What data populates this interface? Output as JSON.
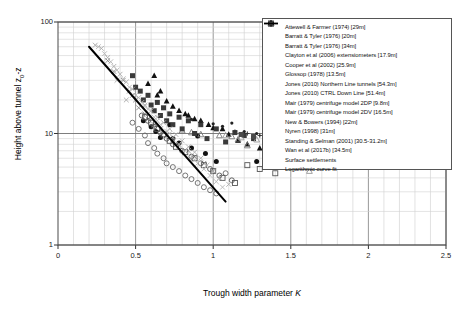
{
  "chart_data": {
    "type": "scatter",
    "title": "",
    "xlabel": "Trough width parameter K",
    "ylabel": "Height above tunnel z0-z",
    "xlim": [
      0,
      2.5
    ],
    "ylim": [
      1,
      100
    ],
    "yscale": "log",
    "xscale": "linear",
    "grid": true,
    "legend_position": "top-right",
    "xticks": [
      "0",
      "0.5",
      "1",
      "1.5",
      "2",
      "2.5"
    ],
    "xtick_values": [
      0,
      0.5,
      1,
      1.5,
      2,
      2.5
    ],
    "yticks": [
      "1",
      "10",
      "100"
    ],
    "ytick_values": [
      1,
      10,
      100
    ],
    "series": [
      {
        "name": "Attewell & Farmer (1974) [29m]",
        "marker": "filled-circle",
        "color": "#111111",
        "points": [
          [
            0.6,
            11.5
          ],
          [
            0.66,
            9.2
          ],
          [
            0.72,
            12.0
          ],
          [
            0.74,
            9.0
          ],
          [
            0.78,
            8.2
          ],
          [
            0.86,
            7.4
          ],
          [
            0.9,
            9.5
          ],
          [
            0.95,
            6.6
          ],
          [
            1.02,
            5.6
          ],
          [
            1.28,
            5.6
          ],
          [
            0.55,
            13.0
          ],
          [
            0.63,
            10.4
          ]
        ]
      },
      {
        "name": "Barratt & Tyler (1976) [20m]",
        "marker": "filled-triangle",
        "color": "#111111",
        "points": [
          [
            0.62,
            33.0
          ],
          [
            0.66,
            24.0
          ],
          [
            0.7,
            19.5
          ],
          [
            0.78,
            16.0
          ],
          [
            0.84,
            14.5
          ],
          [
            0.92,
            13.0
          ],
          [
            0.97,
            12.0
          ],
          [
            1.06,
            11.0
          ],
          [
            1.16,
            8.6
          ],
          [
            1.3,
            7.4
          ],
          [
            1.44,
            6.2
          ]
        ]
      },
      {
        "name": "Barratt & Tyler (1976) [34m]",
        "marker": "filled-triangle",
        "color": "#111111",
        "points": [
          [
            0.58,
            28.0
          ],
          [
            0.64,
            22.0
          ],
          [
            0.74,
            17.5
          ],
          [
            0.82,
            15.0
          ],
          [
            0.88,
            13.5
          ],
          [
            1.0,
            11.2
          ],
          [
            1.1,
            9.8
          ],
          [
            1.22,
            8.0
          ]
        ]
      },
      {
        "name": "Clayton et al (2006) extensometers [17.9m]",
        "marker": "open-triangle",
        "color": "#777777",
        "points": [
          [
            0.86,
            10.2
          ],
          [
            0.92,
            9.8
          ],
          [
            1.04,
            9.6
          ],
          [
            1.12,
            9.4
          ],
          [
            1.16,
            8.8
          ],
          [
            1.22,
            7.8
          ],
          [
            1.34,
            6.2
          ],
          [
            1.48,
            5.2
          ],
          [
            0.8,
            10.6
          ]
        ]
      },
      {
        "name": "Cooper et al (2002) [25.9m]",
        "marker": "x-cross",
        "color": "#888888",
        "points": [
          [
            0.42,
            30.0
          ],
          [
            0.46,
            24.0
          ],
          [
            0.5,
            20.0
          ],
          [
            0.52,
            17.0
          ],
          [
            0.56,
            15.0
          ],
          [
            0.58,
            13.5
          ],
          [
            0.62,
            12.0
          ],
          [
            0.66,
            11.0
          ],
          [
            0.7,
            9.8
          ],
          [
            0.74,
            8.8
          ],
          [
            0.78,
            7.8
          ],
          [
            0.84,
            7.0
          ],
          [
            0.88,
            6.2
          ],
          [
            0.94,
            5.4
          ],
          [
            1.0,
            4.6
          ],
          [
            0.36,
            36.0
          ],
          [
            0.32,
            45.0
          ],
          [
            0.48,
            22.0
          ]
        ]
      },
      {
        "name": "Glossop (1978) [13.5m]",
        "marker": "filled-square",
        "color": "#3a3a3a",
        "points": [
          [
            0.48,
            33.0
          ],
          [
            0.53,
            24.0
          ],
          [
            0.55,
            20.0
          ],
          [
            0.58,
            22.0
          ],
          [
            0.6,
            18.0
          ],
          [
            0.62,
            16.0
          ],
          [
            0.64,
            19.0
          ],
          [
            0.66,
            14.5
          ],
          [
            0.68,
            17.0
          ],
          [
            0.7,
            13.0
          ],
          [
            0.72,
            15.0
          ],
          [
            0.74,
            12.0
          ],
          [
            0.78,
            14.0
          ],
          [
            0.8,
            11.0
          ],
          [
            0.84,
            13.0
          ],
          [
            0.88,
            10.0
          ],
          [
            0.92,
            12.0
          ],
          [
            0.96,
            9.0
          ],
          [
            1.02,
            11.0
          ],
          [
            1.08,
            8.4
          ],
          [
            1.14,
            10.2
          ],
          [
            1.2,
            9.6
          ],
          [
            1.26,
            9.0
          ],
          [
            1.34,
            8.6
          ],
          [
            1.42,
            9.4
          ],
          [
            1.54,
            9.2
          ],
          [
            0.5,
            26.0
          ]
        ]
      },
      {
        "name": "Jones (2010) Northern Line tunnels [54.3m]",
        "marker": "open-triangle",
        "color": "#999999",
        "points": [
          [
            1.08,
            9.6
          ],
          [
            1.18,
            9.2
          ],
          [
            1.28,
            8.8
          ],
          [
            1.38,
            6.0
          ],
          [
            1.52,
            5.4
          ],
          [
            1.62,
            4.6
          ],
          [
            1.74,
            9.0
          ]
        ]
      },
      {
        "name": "Jones (2010) CTRL Down Line [51.4m]",
        "marker": "open-circle",
        "color": "#666666",
        "points": [
          [
            0.52,
            11.0
          ],
          [
            0.56,
            9.6
          ],
          [
            0.58,
            8.2
          ],
          [
            0.62,
            7.4
          ],
          [
            0.64,
            6.6
          ],
          [
            0.68,
            6.0
          ],
          [
            0.7,
            5.4
          ],
          [
            0.74,
            5.0
          ],
          [
            0.78,
            4.6
          ],
          [
            0.82,
            4.2
          ],
          [
            0.86,
            3.9
          ],
          [
            0.9,
            3.6
          ],
          [
            0.94,
            3.3
          ],
          [
            0.98,
            3.1
          ],
          [
            1.02,
            2.9
          ],
          [
            1.08,
            4.4
          ],
          [
            0.48,
            12.5
          ]
        ]
      },
      {
        "name": "Mair (1979) centrifuge model 2DP [9.8m]",
        "marker": "open-circle",
        "color": "#555555",
        "points": [
          [
            0.58,
            13.0
          ],
          [
            0.62,
            11.5
          ],
          [
            0.66,
            10.2
          ],
          [
            0.7,
            9.0
          ],
          [
            0.74,
            8.0
          ],
          [
            0.8,
            7.0
          ],
          [
            0.86,
            6.2
          ],
          [
            0.92,
            5.4
          ],
          [
            0.98,
            4.8
          ],
          [
            1.04,
            4.2
          ],
          [
            1.12,
            3.8
          ],
          [
            0.54,
            14.5
          ]
        ]
      },
      {
        "name": "Mair (1979) centrifuge model 2DV [16.5m]",
        "marker": "open-square",
        "color": "#555555",
        "points": [
          [
            0.6,
            12.5
          ],
          [
            0.64,
            11.0
          ],
          [
            0.68,
            9.8
          ],
          [
            0.72,
            8.6
          ],
          [
            0.76,
            7.6
          ],
          [
            0.82,
            6.8
          ],
          [
            0.88,
            6.0
          ],
          [
            0.94,
            5.2
          ],
          [
            1.0,
            4.6
          ],
          [
            1.06,
            4.0
          ],
          [
            1.14,
            3.6
          ],
          [
            1.22,
            5.2
          ],
          [
            1.3,
            4.8
          ],
          [
            1.4,
            4.4
          ],
          [
            0.56,
            14.0
          ]
        ]
      },
      {
        "name": "New & Bowers (1994) [22m]",
        "marker": "filled-circle-small",
        "color": "#222222",
        "points": [
          [
            0.92,
            12.8
          ],
          [
            1.0,
            12.2
          ],
          [
            1.06,
            11.6
          ],
          [
            1.12,
            12.4
          ],
          [
            1.2,
            10.4
          ],
          [
            1.28,
            10.0
          ],
          [
            1.36,
            9.4
          ],
          [
            1.46,
            9.8
          ],
          [
            0.86,
            13.4
          ]
        ]
      },
      {
        "name": "Nyren (1998) [31m]",
        "marker": "x-cross",
        "color": "#aaaaaa",
        "points": [
          [
            0.28,
            58.0
          ],
          [
            0.32,
            48.0
          ],
          [
            0.36,
            40.0
          ],
          [
            0.4,
            34.0
          ],
          [
            0.44,
            29.0
          ],
          [
            0.48,
            25.0
          ],
          [
            0.52,
            21.0
          ],
          [
            0.56,
            18.0
          ],
          [
            0.6,
            16.0
          ],
          [
            0.64,
            14.0
          ],
          [
            0.68,
            12.5
          ],
          [
            0.72,
            11.0
          ],
          [
            0.76,
            9.8
          ],
          [
            0.8,
            8.6
          ],
          [
            0.84,
            7.6
          ],
          [
            0.88,
            6.8
          ],
          [
            0.92,
            6.0
          ],
          [
            0.96,
            5.2
          ],
          [
            1.0,
            4.6
          ],
          [
            1.04,
            4.0
          ],
          [
            1.1,
            3.5
          ],
          [
            0.24,
            62.0
          ],
          [
            0.44,
            20.0
          ],
          [
            0.38,
            30.0
          ]
        ]
      },
      {
        "name": "Standing & Selman (2001) [30.5-31.2m]",
        "marker": "plus-dot",
        "color": "#333333",
        "points": [
          [
            1.14,
            10.4
          ],
          [
            1.22,
            10.0
          ],
          [
            1.3,
            9.6
          ],
          [
            1.44,
            9.2
          ],
          [
            1.6,
            9.0
          ],
          [
            1.76,
            8.6
          ],
          [
            1.88,
            5.6
          ]
        ]
      },
      {
        "name": "Wan et al (2017b) [34.5m]",
        "marker": "filled-square",
        "color": "#4a4a4a",
        "points": [
          [
            1.18,
            9.8
          ],
          [
            1.26,
            9.4
          ],
          [
            1.34,
            9.0
          ],
          [
            1.48,
            9.6
          ],
          [
            1.58,
            9.2
          ],
          [
            1.68,
            9.0
          ]
        ]
      },
      {
        "name": "Surface settlements",
        "marker": "x-cross",
        "color": "#b5b5b5",
        "points": [
          [
            0.3,
            52.0
          ],
          [
            0.34,
            44.0
          ],
          [
            0.38,
            37.0
          ],
          [
            0.42,
            31.0
          ],
          [
            0.46,
            26.0
          ],
          [
            0.5,
            22.0
          ],
          [
            0.54,
            19.0
          ],
          [
            0.58,
            16.5
          ],
          [
            0.62,
            14.0
          ],
          [
            0.66,
            12.0
          ],
          [
            0.7,
            10.5
          ],
          [
            0.74,
            9.2
          ],
          [
            0.78,
            8.0
          ],
          [
            0.82,
            7.0
          ],
          [
            0.86,
            6.2
          ],
          [
            0.9,
            5.4
          ],
          [
            0.94,
            4.8
          ],
          [
            0.98,
            4.2
          ],
          [
            1.02,
            3.7
          ],
          [
            1.06,
            3.3
          ],
          [
            0.26,
            60.0
          ],
          [
            0.64,
            13.0
          ],
          [
            0.56,
            17.5
          ],
          [
            0.72,
            10.0
          ],
          [
            0.88,
            5.8
          ]
        ]
      }
    ],
    "fit": {
      "name": "Logarithmic curve fit",
      "style": "solid-line",
      "color": "#000000",
      "endpoints": [
        [
          0.2,
          60.0
        ],
        [
          1.08,
          2.45
        ]
      ]
    }
  },
  "legend": {
    "items": [
      {
        "label": "Attewell & Farmer (1974) [29m]",
        "marker": "filled-circle"
      },
      {
        "label": "Barratt & Tyler (1976) [20m]",
        "marker": "filled-triangle"
      },
      {
        "label": "Barratt & Tyler (1976) [34m]",
        "marker": "filled-triangle"
      },
      {
        "label": "Clayton et al (2006) extensiometers [17.9m]",
        "marker": "open-triangle"
      },
      {
        "label": "Cooper et al (2002) [25.9m]",
        "marker": "x-cross"
      },
      {
        "label": "Glossop (1978) [13.5m]",
        "marker": "filled-square"
      },
      {
        "label": "Jones (2010) Northern Line tunnels [54.3m]",
        "marker": "open-triangle"
      },
      {
        "label": "Jones (2010) CTRL Down Line [51.4m]",
        "marker": "open-circle"
      },
      {
        "label": "Mair (1979) centrifuge model 2DP [9.8m]",
        "marker": "open-circle"
      },
      {
        "label": "Mair (1979) centrifuge model 2DV [16.5m]",
        "marker": "open-square"
      },
      {
        "label": "New & Bowers (1994) [22m]",
        "marker": "filled-circle-small"
      },
      {
        "label": "Nyren (1998) [31m]",
        "marker": "x-cross"
      },
      {
        "label": "Standing & Selman (2001) [30.5-31.2m]",
        "marker": "plus-dot"
      },
      {
        "label": "Wan et al (2017b) [34.5m]",
        "marker": "filled-square"
      },
      {
        "label": "Surface settlements",
        "marker": "x-cross"
      },
      {
        "label": "Logarithmic curve fit",
        "marker": "line"
      }
    ]
  },
  "axis_labels": {
    "y_prefix": "Height above tunnel z",
    "y_sub": "0",
    "y_suffix": "-z",
    "x_prefix": "Trough width parameter ",
    "x_italic": "K"
  }
}
